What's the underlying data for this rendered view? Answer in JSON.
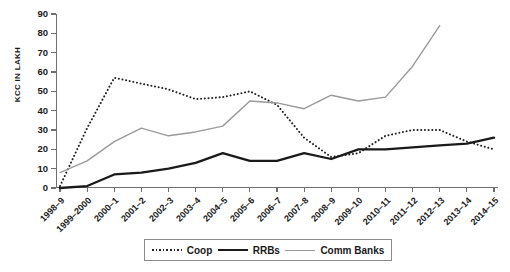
{
  "chart_data": {
    "type": "line",
    "title": "",
    "xlabel": "",
    "ylabel": "KCC IN LAKH",
    "ylim": [
      0,
      90
    ],
    "ytick_step": 10,
    "yticks": [
      0,
      10,
      20,
      30,
      40,
      50,
      60,
      70,
      80,
      90
    ],
    "grid": false,
    "legend_position": "bottom-center",
    "categories": [
      "1998–9",
      "1999–2000",
      "2000–1",
      "2001–2",
      "2002–3",
      "2003–4",
      "2004–5",
      "2005–6",
      "2006–7",
      "2007–8",
      "2008–9",
      "2009–10",
      "2010–11",
      "2011–12",
      "2012–13",
      "2013–14",
      "2014–15"
    ],
    "series": [
      {
        "name": "Coop",
        "style": "dotted",
        "color": "#222222",
        "values": [
          1,
          31,
          57,
          54,
          51,
          46,
          47,
          50,
          43,
          26,
          16,
          18,
          27,
          30,
          30,
          24,
          20
        ]
      },
      {
        "name": "RRBs",
        "style": "solid-thick",
        "color": "#1a1a1a",
        "values": [
          0,
          1,
          7,
          8,
          10,
          13,
          18,
          14,
          14,
          18,
          15,
          20,
          20,
          21,
          22,
          23,
          26
        ]
      },
      {
        "name": "Comm Banks",
        "style": "solid-thin",
        "color": "#9a9a9a",
        "values": [
          8,
          14,
          24,
          31,
          27,
          29,
          32,
          45,
          44,
          41,
          48,
          45,
          47,
          63,
          84,
          null,
          null
        ]
      }
    ]
  },
  "legend": {
    "items": [
      {
        "label": "Coop",
        "swatch": "dotted-line-swatch"
      },
      {
        "label": "RRBs",
        "swatch": "thick-line-swatch"
      },
      {
        "label": "Comm Banks",
        "swatch": "thin-gray-line-swatch"
      }
    ]
  }
}
